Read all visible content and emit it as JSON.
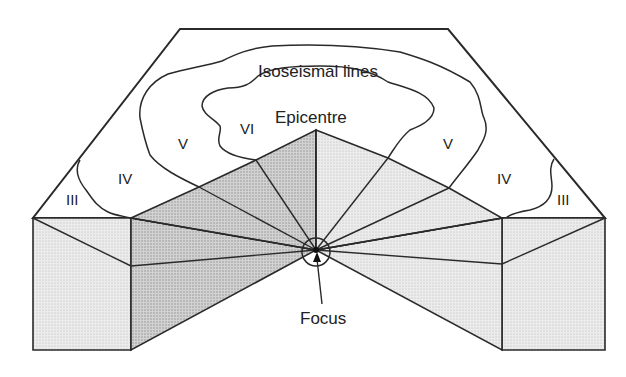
{
  "figure": {
    "labels": {
      "isoseismal": "Isoseismal lines",
      "epicentre": "Epicentre",
      "focus": "Focus"
    },
    "intensity_zones": [
      {
        "id": "left-III",
        "label": "III"
      },
      {
        "id": "left-IV",
        "label": "IV"
      },
      {
        "id": "left-V",
        "label": "V"
      },
      {
        "id": "VI",
        "label": "VI"
      },
      {
        "id": "right-V",
        "label": "V"
      },
      {
        "id": "right-IV",
        "label": "IV"
      },
      {
        "id": "right-III",
        "label": "III"
      }
    ],
    "colors": {
      "line": "#2a2a2a",
      "shade_dark": "#c4c4c4",
      "shade_light": "#e6e6e6",
      "background": "#ffffff"
    }
  }
}
